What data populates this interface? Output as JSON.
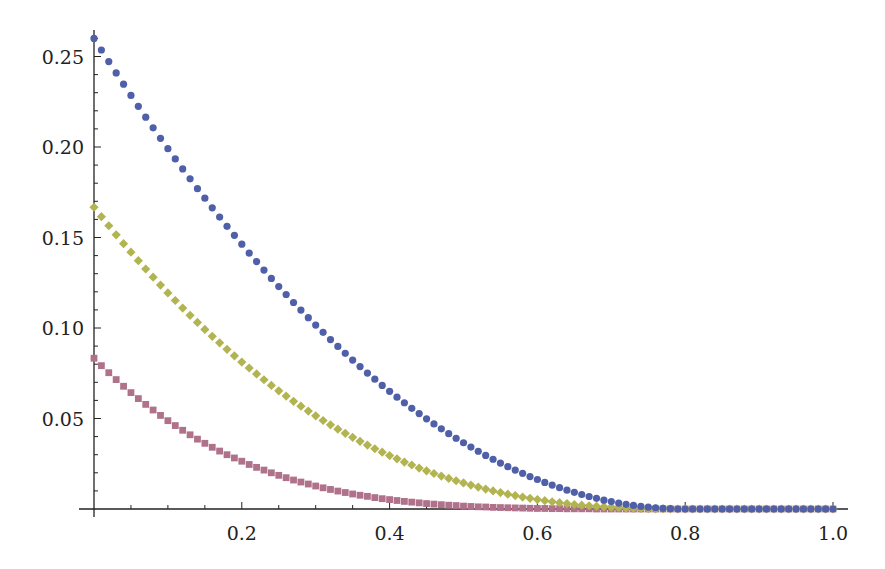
{
  "chart_data": {
    "type": "scatter",
    "title": "",
    "xlabel": "",
    "ylabel": "",
    "xlim": [
      0,
      1.0
    ],
    "ylim": [
      0,
      0.26
    ],
    "grid": false,
    "legend": null,
    "x_ticks": [
      0.2,
      0.4,
      0.6,
      0.8,
      1.0
    ],
    "x_tick_labels": [
      "0.2",
      "0.4",
      "0.6",
      "0.8",
      "1.0"
    ],
    "y_ticks": [
      0.05,
      0.1,
      0.15,
      0.2,
      0.25
    ],
    "y_tick_labels": [
      "0.05",
      "0.10",
      "0.15",
      "0.20",
      "0.25"
    ],
    "x_start": 0,
    "x_step": 0.01,
    "series": [
      {
        "name": "series-1",
        "marker": "circle",
        "color": "#4f5fa8",
        "values": [
          0.26,
          0.2536,
          0.2472,
          0.2409,
          0.2347,
          0.2285,
          0.2225,
          0.2165,
          0.2106,
          0.2048,
          0.1991,
          0.1934,
          0.1879,
          0.1824,
          0.177,
          0.1717,
          0.1664,
          0.1613,
          0.1562,
          0.1512,
          0.1463,
          0.1414,
          0.1367,
          0.132,
          0.1274,
          0.1229,
          0.1185,
          0.1141,
          0.1099,
          0.1057,
          0.1016,
          0.0976,
          0.0936,
          0.0898,
          0.086,
          0.0823,
          0.0787,
          0.0751,
          0.0717,
          0.0683,
          0.065,
          0.0618,
          0.0587,
          0.0556,
          0.0527,
          0.0498,
          0.047,
          0.0443,
          0.0416,
          0.0391,
          0.0366,
          0.0342,
          0.0319,
          0.0296,
          0.0275,
          0.0254,
          0.0234,
          0.0215,
          0.0197,
          0.0179,
          0.0163,
          0.0147,
          0.0132,
          0.0118,
          0.0104,
          0.0092,
          0.008,
          0.0069,
          0.0059,
          0.0049,
          0.0041,
          0.0033,
          0.0026,
          0.002,
          0.0015,
          0.001,
          0.0007,
          0.0004,
          0.0002,
          0.0,
          0,
          0,
          0,
          0,
          0,
          0,
          0,
          0,
          0,
          0,
          0,
          0,
          0,
          0,
          0,
          0,
          0,
          0,
          0,
          0,
          0
        ]
      },
      {
        "name": "series-2",
        "marker": "diamond",
        "color": "#b2b452",
        "values": [
          0.1667,
          0.1615,
          0.1565,
          0.1515,
          0.1466,
          0.1419,
          0.1372,
          0.1326,
          0.1281,
          0.1237,
          0.1194,
          0.1152,
          0.111,
          0.107,
          0.1031,
          0.0992,
          0.0954,
          0.0918,
          0.0882,
          0.0846,
          0.0812,
          0.0779,
          0.0746,
          0.0714,
          0.0683,
          0.0653,
          0.0624,
          0.0595,
          0.0568,
          0.0541,
          0.0515,
          0.0489,
          0.0465,
          0.0441,
          0.0418,
          0.0396,
          0.0374,
          0.0353,
          0.0333,
          0.0314,
          0.0295,
          0.0277,
          0.0259,
          0.0243,
          0.0226,
          0.0211,
          0.0196,
          0.0182,
          0.0169,
          0.0156,
          0.0144,
          0.0132,
          0.0121,
          0.011,
          0.01,
          0.0091,
          0.0082,
          0.0074,
          0.0066,
          0.0059,
          0.0052,
          0.0046,
          0.004,
          0.0035,
          0.003,
          0.0025,
          0.0021,
          0.0018,
          0.0015,
          0.0012,
          0.0009,
          0.0007,
          0.0005,
          0.0004,
          0.0003,
          0.0002,
          0.0001,
          0.0001,
          0.0,
          0.0,
          0,
          0,
          0,
          0,
          0,
          0,
          0,
          0,
          0,
          0,
          0,
          0,
          0,
          0,
          0,
          0,
          0,
          0,
          0,
          0,
          0
        ]
      },
      {
        "name": "series-3",
        "marker": "square",
        "color": "#b0728a",
        "values": [
          0.0833,
          0.0792,
          0.0753,
          0.0715,
          0.0678,
          0.0643,
          0.061,
          0.0578,
          0.0547,
          0.0517,
          0.0488,
          0.0461,
          0.0435,
          0.041,
          0.0386,
          0.0363,
          0.0341,
          0.032,
          0.03,
          0.0282,
          0.0264,
          0.0246,
          0.023,
          0.0215,
          0.02,
          0.0186,
          0.0173,
          0.016,
          0.0149,
          0.0138,
          0.0127,
          0.0117,
          0.0108,
          0.0099,
          0.0091,
          0.0083,
          0.0076,
          0.007,
          0.0063,
          0.0057,
          0.0052,
          0.0047,
          0.0042,
          0.0038,
          0.0034,
          0.003,
          0.0027,
          0.0024,
          0.0021,
          0.0019,
          0.0016,
          0.0014,
          0.0012,
          0.0011,
          0.0009,
          0.0008,
          0.0007,
          0.0006,
          0.0005,
          0.0004,
          0.0003,
          0.0003,
          0.0002,
          0.0002,
          0.0001,
          0.0001,
          0.0001,
          0.0001,
          0,
          0,
          0,
          0,
          0,
          0,
          0,
          0,
          0,
          0,
          0,
          0,
          0,
          0,
          0,
          0,
          0,
          0,
          0,
          0,
          0,
          0,
          0,
          0,
          0,
          0,
          0,
          0,
          0,
          0,
          0,
          0,
          0
        ]
      }
    ]
  },
  "layout": {
    "origin_px": [
      94,
      509
    ],
    "x_px_per_unit": 739,
    "y_px_per_unit": 1810,
    "axis_color": "#222222",
    "zero_line_color": "#c8cc6a"
  }
}
